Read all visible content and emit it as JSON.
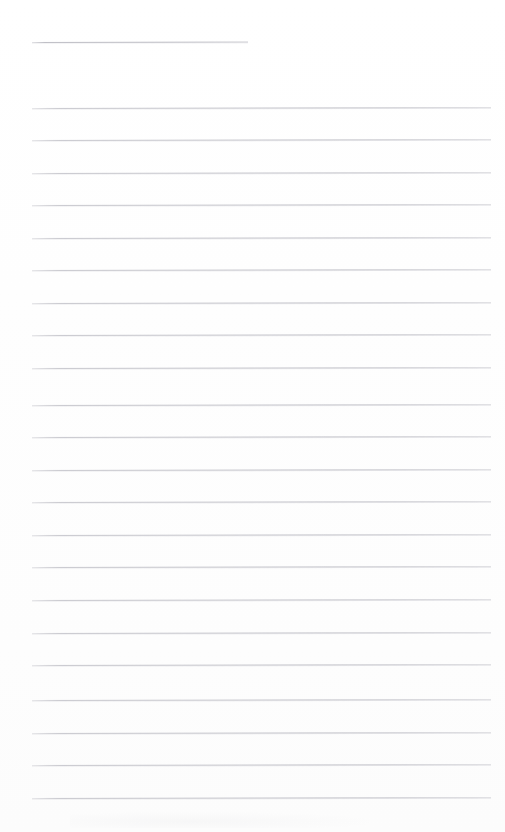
{
  "document": {
    "type": "scanned-lined-notepad-page",
    "title": "",
    "body_text": "",
    "page_width": 505,
    "page_height": 832,
    "background_color": "#fefefe",
    "is_blank": true,
    "visible_text": []
  },
  "ruling": {
    "line_color": "#c9c9cf",
    "title_rule_color": "#bfbfc6",
    "line_thickness_px": 1,
    "left_margin_px": 32,
    "right_edge_px": 491,
    "line_spacing_px": 32.5,
    "total_rule_count": 23,
    "full_width_rule_count": 22,
    "short_rule_count": 1,
    "skew_deg": -0.12
  },
  "rules": [
    {
      "name": "title-rule",
      "x": 32,
      "y": 42,
      "width": 216,
      "short": true
    },
    {
      "name": "body-rule-1",
      "x": 32,
      "y": 108,
      "width": 459,
      "short": false
    },
    {
      "name": "body-rule-2",
      "x": 32,
      "y": 140,
      "width": 459,
      "short": false
    },
    {
      "name": "body-rule-3",
      "x": 32,
      "y": 173,
      "width": 459,
      "short": false
    },
    {
      "name": "body-rule-4",
      "x": 32,
      "y": 205,
      "width": 459,
      "short": false
    },
    {
      "name": "body-rule-5",
      "x": 32,
      "y": 238,
      "width": 459,
      "short": false
    },
    {
      "name": "body-rule-6",
      "x": 32,
      "y": 270,
      "width": 459,
      "short": false
    },
    {
      "name": "body-rule-7",
      "x": 32,
      "y": 303,
      "width": 459,
      "short": false
    },
    {
      "name": "body-rule-8",
      "x": 32,
      "y": 335,
      "width": 459,
      "short": false
    },
    {
      "name": "body-rule-9",
      "x": 32,
      "y": 368,
      "width": 459,
      "short": false
    },
    {
      "name": "body-rule-10",
      "x": 32,
      "y": 405,
      "width": 459,
      "short": false
    },
    {
      "name": "body-rule-11",
      "x": 32,
      "y": 437,
      "width": 459,
      "short": false
    },
    {
      "name": "body-rule-12",
      "x": 32,
      "y": 470,
      "width": 459,
      "short": false
    },
    {
      "name": "body-rule-13",
      "x": 32,
      "y": 502,
      "width": 459,
      "short": false
    },
    {
      "name": "body-rule-14",
      "x": 32,
      "y": 535,
      "width": 459,
      "short": false
    },
    {
      "name": "body-rule-15",
      "x": 32,
      "y": 567,
      "width": 459,
      "short": false
    },
    {
      "name": "body-rule-16",
      "x": 32,
      "y": 600,
      "width": 459,
      "short": false
    },
    {
      "name": "body-rule-17",
      "x": 32,
      "y": 633,
      "width": 459,
      "short": false
    },
    {
      "name": "body-rule-18",
      "x": 32,
      "y": 665,
      "width": 459,
      "short": false
    },
    {
      "name": "body-rule-19",
      "x": 32,
      "y": 700,
      "width": 459,
      "short": false
    },
    {
      "name": "body-rule-20",
      "x": 32,
      "y": 733,
      "width": 459,
      "short": false
    },
    {
      "name": "body-rule-21",
      "x": 32,
      "y": 765,
      "width": 459,
      "short": false
    },
    {
      "name": "body-rule-22",
      "x": 32,
      "y": 798,
      "width": 459,
      "short": false
    }
  ]
}
